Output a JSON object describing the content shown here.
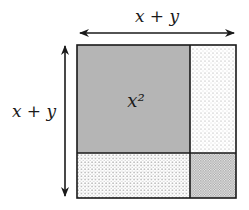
{
  "diagram": {
    "type": "area-model",
    "top_label": "x + y",
    "left_label": "x + y",
    "regions": [
      {
        "id": "x2",
        "label": "x²",
        "fill": "#b5b5b5",
        "pattern": "solid"
      },
      {
        "id": "xy_right",
        "label": "",
        "fill": "#ffffff",
        "pattern": "sparse-dots"
      },
      {
        "id": "xy_bottom",
        "label": "",
        "fill": "#ffffff",
        "pattern": "dots"
      },
      {
        "id": "y2",
        "label": "",
        "fill": "#ffffff",
        "pattern": "dense-dots"
      }
    ],
    "colors": {
      "stroke": "#1a1a1a",
      "x2_fill": "#b5b5b5",
      "dot": "#8a8a8a"
    }
  }
}
